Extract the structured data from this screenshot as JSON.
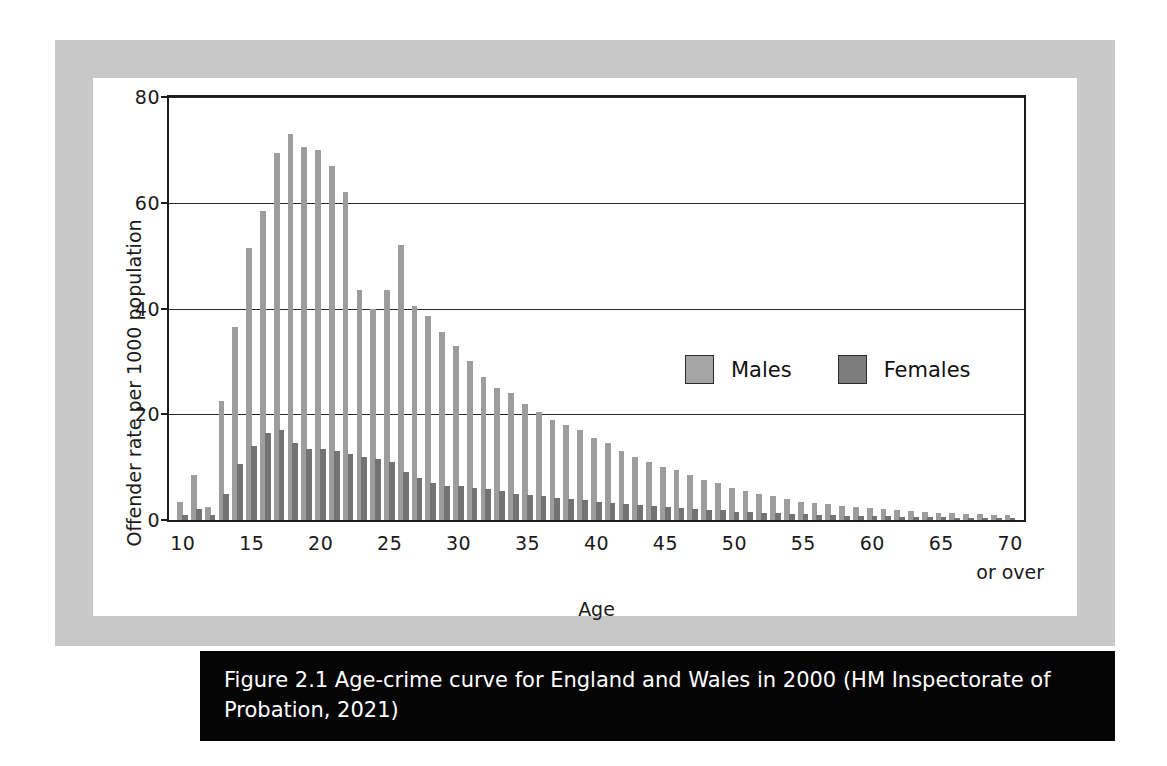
{
  "figure": {
    "caption": "Figure 2.1 Age-crime curve for England and Wales in 2000 (HM Inspectorate of Probation, 2021)"
  },
  "legend": {
    "items": [
      {
        "label": "Males",
        "color": "#a5a5a5"
      },
      {
        "label": "Females",
        "color": "#7d7d7d"
      }
    ]
  },
  "axis": {
    "x_over_note": "or over"
  },
  "chart_data": {
    "type": "bar",
    "title": "",
    "xlabel": "Age",
    "ylabel": "Offender rate per 1000 population",
    "ylim": [
      0,
      80
    ],
    "yticks": [
      0,
      20,
      40,
      60,
      80
    ],
    "xticks": [
      10,
      15,
      20,
      25,
      30,
      35,
      40,
      45,
      50,
      55,
      60,
      65,
      70
    ],
    "xtick_labels": [
      "10",
      "15",
      "20",
      "25",
      "30",
      "35",
      "40",
      "45",
      "50",
      "55",
      "60",
      "65",
      "70"
    ],
    "xlim": [
      9,
      71
    ],
    "grid": "horizontal",
    "legend_position": "inside-right",
    "categories": [
      10,
      11,
      12,
      13,
      14,
      15,
      16,
      17,
      18,
      19,
      20,
      21,
      22,
      23,
      24,
      25,
      26,
      27,
      28,
      29,
      30,
      31,
      32,
      33,
      34,
      35,
      36,
      37,
      38,
      39,
      40,
      41,
      42,
      43,
      44,
      45,
      46,
      47,
      48,
      49,
      50,
      51,
      52,
      53,
      54,
      55,
      56,
      57,
      58,
      59,
      60,
      61,
      62,
      63,
      64,
      65,
      66,
      67,
      68,
      69,
      70
    ],
    "series": [
      {
        "name": "Males",
        "color": "#9d9d9d",
        "values": [
          3.5,
          8.5,
          2.5,
          22.5,
          36.5,
          51.5,
          58.5,
          69.5,
          73.0,
          70.5,
          70.0,
          67.0,
          62.0,
          43.5,
          40.0,
          43.5,
          52.0,
          40.5,
          38.5,
          35.5,
          33.0,
          30.0,
          27.0,
          25.0,
          24.0,
          22.0,
          20.5,
          19.0,
          18.0,
          17.0,
          15.5,
          14.5,
          13.0,
          12.0,
          11.0,
          10.0,
          9.5,
          8.5,
          7.5,
          7.0,
          6.0,
          5.5,
          5.0,
          4.5,
          4.0,
          3.5,
          3.2,
          3.0,
          2.7,
          2.5,
          2.3,
          2.1,
          1.9,
          1.7,
          1.6,
          1.4,
          1.3,
          1.2,
          1.1,
          1.0,
          0.9
        ]
      },
      {
        "name": "Females",
        "color": "#737373",
        "values": [
          1.0,
          2.0,
          1.0,
          5.0,
          10.5,
          14.0,
          16.5,
          17.0,
          14.5,
          13.5,
          13.5,
          13.0,
          12.5,
          12.0,
          11.5,
          11.0,
          9.0,
          8.0,
          7.0,
          6.5,
          6.5,
          6.0,
          5.8,
          5.5,
          5.0,
          4.8,
          4.5,
          4.2,
          4.0,
          3.8,
          3.5,
          3.3,
          3.0,
          2.8,
          2.6,
          2.4,
          2.2,
          2.0,
          1.9,
          1.8,
          1.6,
          1.5,
          1.4,
          1.3,
          1.2,
          1.1,
          1.0,
          0.9,
          0.85,
          0.8,
          0.75,
          0.7,
          0.65,
          0.6,
          0.55,
          0.5,
          0.45,
          0.4,
          0.38,
          0.35,
          0.3
        ]
      }
    ]
  }
}
